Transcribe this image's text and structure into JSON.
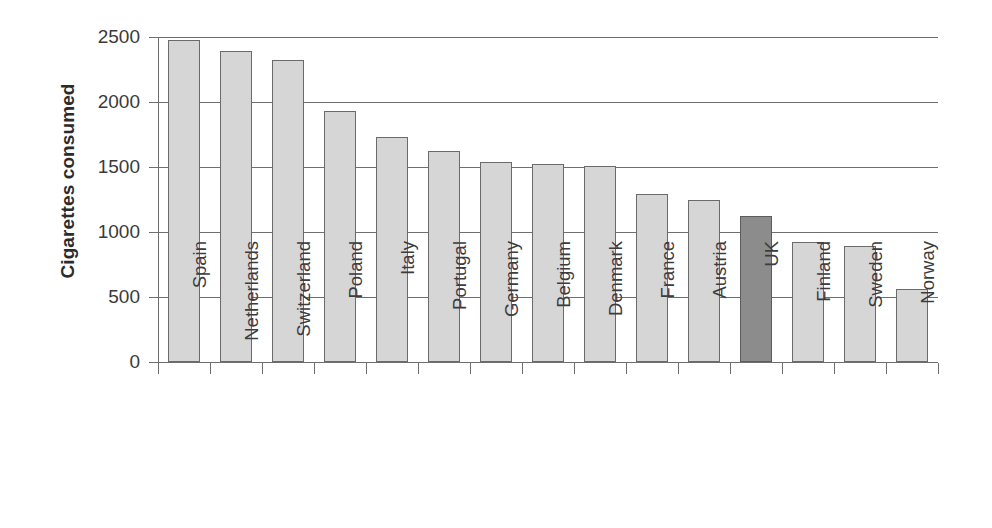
{
  "chart_data": {
    "type": "bar",
    "title": "",
    "xlabel": "",
    "ylabel": "Cigarettes consumed",
    "ylim": [
      0,
      2500
    ],
    "ytick_interval": 500,
    "yticks": [
      2500,
      2000,
      1500,
      1000,
      500,
      0
    ],
    "ytick_labels": [
      "2500",
      "2000",
      "1500",
      "1000",
      "500",
      "0"
    ],
    "grid": true,
    "grid_axis": "y",
    "legend": false,
    "legend_position": "none",
    "categories": [
      "Spain",
      "Netherlands",
      "Switzerland",
      "Poland",
      "Italy",
      "Portugal",
      "Germany",
      "Belgium",
      "Denmark",
      "France",
      "Austria",
      "UK",
      "Finland",
      "Sweden",
      "Norway"
    ],
    "values": [
      2475,
      2395,
      2320,
      1930,
      1730,
      1625,
      1540,
      1525,
      1510,
      1295,
      1250,
      1120,
      920,
      895,
      565
    ],
    "highlight_category": "UK",
    "highlight_index": 11,
    "colors": {
      "bar_fill": "#d6d6d6",
      "bar_stroke": "#6b6b6b",
      "highlight_fill": "#8c8c8c",
      "highlight_stroke": "#5c5c5c",
      "gridline": "#6e6e6e",
      "axis": "#6e6e6e",
      "text": "#3a3a3a",
      "axis_title": "#2b2b2b",
      "background": "#ffffff"
    }
  }
}
